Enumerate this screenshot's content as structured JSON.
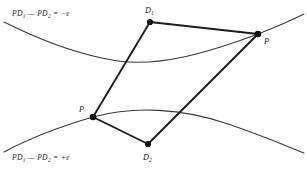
{
  "figure": {
    "background_color": "#ffffff",
    "curve_color": "#3a3a3c",
    "edge_color": "#1c1c1e",
    "vertex_color": "#111113",
    "width": 307,
    "height": 175
  },
  "equations": {
    "upper": {
      "full_text": "PD1 - PD2 = -e",
      "prefix": "PD",
      "sub1": "1",
      "middle": " — PD",
      "sub2": "2",
      "suffix": " = −e",
      "x": 12,
      "y": 16
    },
    "lower": {
      "full_text": "PD1 - PD2 = +e",
      "prefix": "PD",
      "sub1": "1",
      "middle": " — PD",
      "sub2": "2",
      "suffix": " = +e",
      "x": 12,
      "y": 160
    }
  },
  "points": [
    {
      "id": "d1",
      "base": "D",
      "sub": "1",
      "vertex_x": 150,
      "vertex_y": 22,
      "label_x": 145,
      "label_y": 13
    },
    {
      "id": "p-right",
      "base": "P",
      "sub": "",
      "vertex_x": 258,
      "vertex_y": 34,
      "label_x": 264,
      "label_y": 44
    },
    {
      "id": "p-left",
      "base": "P",
      "sub": "",
      "vertex_x": 93,
      "vertex_y": 117,
      "label_x": 79,
      "label_y": 112
    },
    {
      "id": "d2",
      "base": "D",
      "sub": "2",
      "vertex_x": 148,
      "vertex_y": 144,
      "label_x": 143,
      "label_y": 160
    }
  ],
  "quadrilateral": {
    "name": "quadrilateral-d1-p-d2-p",
    "path": "M 150 22 L 258 34 L 148 144 L 93 117 Z"
  },
  "curves": [
    {
      "id": "upper-branch",
      "name": "upper-hyperbola-branch",
      "path": "M 4 22 C 40 40 78 55 118 61 C 160 67 210 52 258 34 C 276 27 292 20 304 14"
    },
    {
      "id": "lower-branch",
      "name": "lower-hyperbola-branch",
      "path": "M 4 152 C 30 138 62 126 93 117 C 134 106 182 108 228 124 C 258 134 284 145 304 153"
    }
  ]
}
